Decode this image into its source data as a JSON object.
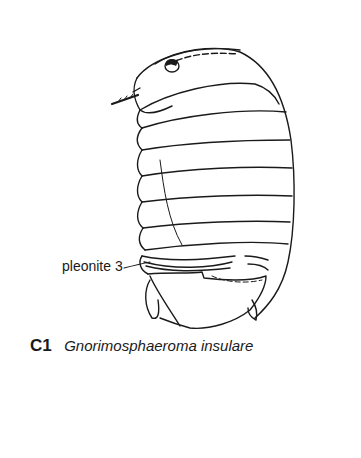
{
  "figure": {
    "line_color": "#1a1a1a",
    "background": "#ffffff"
  },
  "labels": {
    "pleonite": "pleonite 3"
  },
  "caption": {
    "id": "C1",
    "species": "Gnorimosphaeroma insulare"
  }
}
